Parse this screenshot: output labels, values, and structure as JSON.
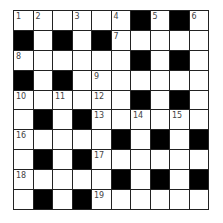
{
  "puzzle": {
    "rows": 10,
    "cols": 10,
    "colors": {
      "block": "#000000",
      "cell": "#ffffff",
      "border": "#222222",
      "number": "#444444"
    },
    "layout": [
      "..........",
      "#.#.#.....",
      "......#.#.",
      "#.#.......",
      "......#.#.",
      ".#.#......",
      ".....#.#.#",
      ".#.#......",
      ".....#.#.#",
      ".#.#......"
    ],
    "grid_fix_row0": "......#.#.",
    "numbers": [
      {
        "r": 0,
        "c": 0,
        "n": "1"
      },
      {
        "r": 0,
        "c": 1,
        "n": "2"
      },
      {
        "r": 0,
        "c": 3,
        "n": "3"
      },
      {
        "r": 0,
        "c": 5,
        "n": "4"
      },
      {
        "r": 0,
        "c": 7,
        "n": "5"
      },
      {
        "r": 0,
        "c": 9,
        "n": "6"
      },
      {
        "r": 1,
        "c": 5,
        "n": "7"
      },
      {
        "r": 2,
        "c": 0,
        "n": "8"
      },
      {
        "r": 3,
        "c": 4,
        "n": "9"
      },
      {
        "r": 4,
        "c": 0,
        "n": "10"
      },
      {
        "r": 4,
        "c": 2,
        "n": "11"
      },
      {
        "r": 4,
        "c": 4,
        "n": "12"
      },
      {
        "r": 5,
        "c": 4,
        "n": "13"
      },
      {
        "r": 5,
        "c": 6,
        "n": "14"
      },
      {
        "r": 5,
        "c": 8,
        "n": "15"
      },
      {
        "r": 6,
        "c": 0,
        "n": "16"
      },
      {
        "r": 7,
        "c": 4,
        "n": "17"
      },
      {
        "r": 8,
        "c": 0,
        "n": "18"
      },
      {
        "r": 9,
        "c": 4,
        "n": "19"
      }
    ]
  }
}
